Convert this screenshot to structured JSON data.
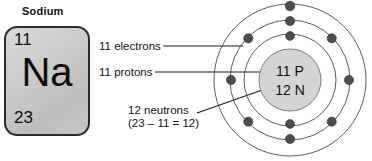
{
  "diagram": {
    "element": {
      "name": "Sodium",
      "symbol": "Na",
      "atomic_number": "11",
      "mass_number": "23"
    },
    "callouts": {
      "electrons": "11 electrons",
      "protons": "11 protons",
      "neutrons": "12 neutrons",
      "neutrons_math": "(23 – 11 = 12)"
    },
    "nucleus": {
      "protons_label": "11 P",
      "neutrons_label": "12 N"
    },
    "colors": {
      "box_fill": "#cccccc",
      "box_border": "#2b2b2b",
      "nucleus_fill": "#d4d4d4",
      "nucleus_stroke": "#5a5a5a",
      "shell_stroke": "#4a4a4a",
      "electron_fill": "#4d4d4d",
      "leader_line": "#1a1a1a",
      "text": "#111111"
    },
    "shells": [
      {
        "index": 1,
        "electron_count": 2,
        "radius": 44
      },
      {
        "index": 2,
        "electron_count": 8,
        "radius": 58
      },
      {
        "index": 3,
        "electron_count": 1,
        "radius": 74
      }
    ],
    "totals": {
      "electrons": 11,
      "protons": 11,
      "neutrons": 12
    }
  }
}
